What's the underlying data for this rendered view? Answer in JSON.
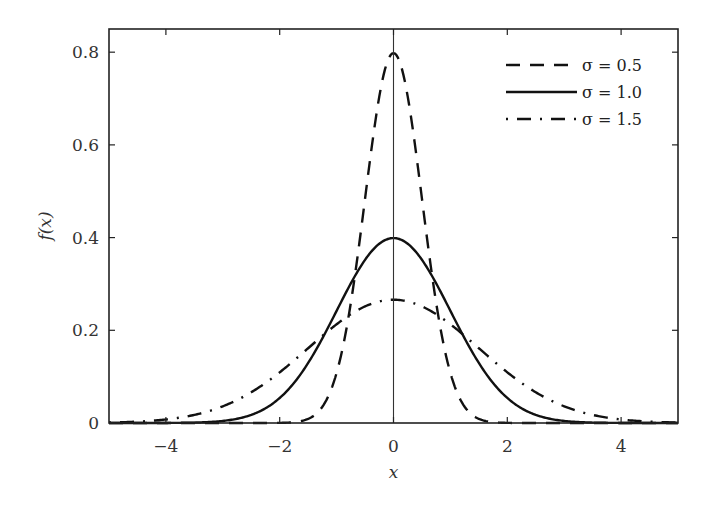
{
  "chart_data": {
    "type": "line",
    "title": "",
    "xlabel": "x",
    "ylabel": "f(x)",
    "xlim": [
      -5,
      5
    ],
    "ylim": [
      0,
      0.85
    ],
    "xticks": [
      -4,
      -2,
      0,
      2,
      4
    ],
    "xtick_labels": [
      "−4",
      "−2",
      "0",
      "2",
      "4"
    ],
    "yticks": [
      0,
      0.2,
      0.4,
      0.6,
      0.8
    ],
    "ytick_labels": [
      "0",
      "0.2",
      "0.4",
      "0.6",
      "0.8"
    ],
    "grid": false,
    "vertical_reference_line_x": 0,
    "legend_position": "upper right",
    "function": "normal pdf with mean 0",
    "series": [
      {
        "name": "σ = 0.5",
        "sigma": 0.5,
        "style": "dashed",
        "peak": 0.798,
        "x": [
          -2,
          -1.5,
          -1,
          -0.5,
          0,
          0.5,
          1,
          1.5,
          2
        ],
        "values": [
          0.0003,
          0.0089,
          0.108,
          0.484,
          0.798,
          0.484,
          0.108,
          0.0089,
          0.0003
        ]
      },
      {
        "name": "σ = 1.0",
        "sigma": 1.0,
        "style": "solid",
        "peak": 0.399,
        "x": [
          -4,
          -3,
          -2,
          -1,
          0,
          1,
          2,
          3,
          4
        ],
        "values": [
          0.0001,
          0.0044,
          0.054,
          0.242,
          0.399,
          0.242,
          0.054,
          0.0044,
          0.0001
        ]
      },
      {
        "name": "σ = 1.5",
        "sigma": 1.5,
        "style": "dash-dot",
        "peak": 0.266,
        "x": [
          -5,
          -4,
          -3,
          -2,
          -1,
          0,
          1,
          2,
          3,
          4,
          5
        ],
        "values": [
          0.001,
          0.0076,
          0.036,
          0.109,
          0.213,
          0.266,
          0.213,
          0.109,
          0.036,
          0.0076,
          0.001
        ]
      }
    ]
  },
  "legend": {
    "items": [
      {
        "label": "σ = 0.5",
        "style": "dashed"
      },
      {
        "label": "σ = 1.0",
        "style": "solid"
      },
      {
        "label": "σ = 1.5",
        "style": "dash-dot"
      }
    ]
  },
  "axes": {
    "xlabel": "x",
    "ylabel": "f(x)"
  }
}
